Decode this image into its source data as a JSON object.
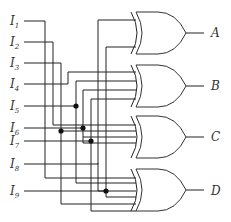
{
  "inputs": [
    {
      "name": "I",
      "sub": "1"
    },
    {
      "name": "I",
      "sub": "2"
    },
    {
      "name": "I",
      "sub": "3"
    },
    {
      "name": "I",
      "sub": "4"
    },
    {
      "name": "I",
      "sub": "5"
    },
    {
      "name": "I",
      "sub": "6"
    },
    {
      "name": "I",
      "sub": "7"
    },
    {
      "name": "I",
      "sub": "8"
    },
    {
      "name": "I",
      "sub": "9"
    }
  ],
  "gates": [
    {
      "type": "XOR",
      "output": "A"
    },
    {
      "type": "XOR",
      "output": "B"
    },
    {
      "type": "XOR",
      "output": "C"
    },
    {
      "type": "XOR",
      "output": "D"
    }
  ],
  "colors": {
    "wire": "#222222",
    "label": "#333333",
    "background": "#ffffff"
  }
}
